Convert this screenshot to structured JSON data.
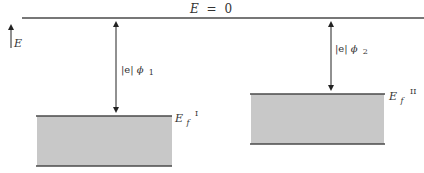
{
  "diagram": {
    "type": "energy-band-diagram",
    "reference_level": {
      "label_lhs": "E",
      "label_eq": "=",
      "label_rhs": "0"
    },
    "energy_axis": {
      "label": "E"
    },
    "metal_1": {
      "work_function_label_prefix": "|e|",
      "work_function_symbol": "ϕ",
      "work_function_subscript": "1",
      "fermi_label_main": "E",
      "fermi_label_sub": "f",
      "fermi_label_sup": "I"
    },
    "metal_2": {
      "work_function_label_prefix": "|e|",
      "work_function_symbol": "ϕ",
      "work_function_subscript": "2",
      "fermi_label_main": "E",
      "fermi_label_sub": "f",
      "fermi_label_sup": "II"
    },
    "colors": {
      "line": "#4a4a4a",
      "band_fill": "#c8c8c8",
      "text": "#333333",
      "background": "#ffffff"
    }
  }
}
